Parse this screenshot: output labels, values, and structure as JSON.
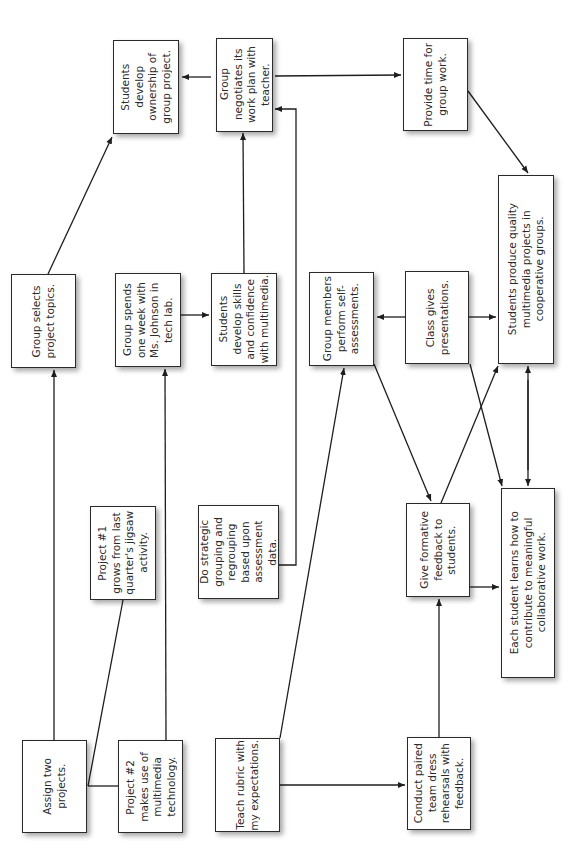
{
  "diagram": {
    "type": "concept-map",
    "orientation": "rotated-90-ccw",
    "nodes": {
      "assign": {
        "label": "Assign two\nprojects."
      },
      "project2": {
        "label": "Project #2\nmakes use of\nmultimedia\ntechnology."
      },
      "project1": {
        "label": "Project #1\ngrows from last\nquarter's jigsaw\nactivity."
      },
      "selects": {
        "label": "Group selects\nproject topics."
      },
      "spends": {
        "label": "Group spends\none week with\nMs. Johnson in\ntech lab."
      },
      "ownership": {
        "label": "Students\ndevelop\nownership of\ngroup project."
      },
      "negotiates": {
        "label": "Group\nnegotiates its\nwork plan with\nteacher."
      },
      "provide_time": {
        "label": "Provide time for\ngroup work."
      },
      "skills": {
        "label": "Students\ndevelop skills\nand confidence\nwith multimedia."
      },
      "strategic": {
        "label": "Do strategic\ngrouping and\nregrouping\nbased upon\nassessment\ndata."
      },
      "self_assess": {
        "label": "Group members\nperform self-\nassessments."
      },
      "presentations": {
        "label": "Class gives\npresentations."
      },
      "quality": {
        "label": "Students produce quality\nmultimedia projects in\ncooperative groups."
      },
      "formative": {
        "label": "Give formative\nfeedback to\nstudents."
      },
      "each_student": {
        "label": "Each student learns how to\ncontribute to meaningful\ncollaborative work."
      },
      "rubric": {
        "label": "Teach rubric with\nmy expectations."
      },
      "rehearsals": {
        "label": "Conduct paired\nteam dress\nrehearsals with\nfeedback."
      }
    },
    "edges": [
      {
        "from": "assign",
        "to": "selects"
      },
      {
        "from": "project1",
        "to": "assign"
      },
      {
        "from": "project2",
        "to": "assign"
      },
      {
        "from": "project2",
        "to": "spends"
      },
      {
        "from": "selects",
        "to": "ownership"
      },
      {
        "from": "spends",
        "to": "skills"
      },
      {
        "from": "skills",
        "to": "negotiates"
      },
      {
        "from": "strategic",
        "to": "negotiates"
      },
      {
        "from": "negotiates",
        "to": "ownership"
      },
      {
        "from": "negotiates",
        "to": "provide_time"
      },
      {
        "from": "provide_time",
        "to": "quality"
      },
      {
        "from": "rubric",
        "to": "self_assess"
      },
      {
        "from": "rubric",
        "to": "rehearsals"
      },
      {
        "from": "rehearsals",
        "to": "formative"
      },
      {
        "from": "self_assess",
        "to": "formative"
      },
      {
        "from": "presentations",
        "to": "self_assess"
      },
      {
        "from": "presentations",
        "to": "quality"
      },
      {
        "from": "presentations",
        "to": "each_student"
      },
      {
        "from": "formative",
        "to": "quality"
      },
      {
        "from": "formative",
        "to": "each_student"
      },
      {
        "from": "quality",
        "to": "each_student",
        "bidirectional": true
      }
    ]
  }
}
